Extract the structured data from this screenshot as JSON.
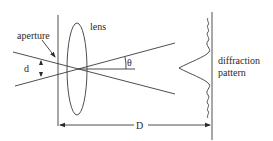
{
  "diagram": {
    "type": "optics-diffraction-setup",
    "labels": {
      "aperture": "aperture",
      "lens": "lens",
      "d": "d",
      "theta": "θ",
      "D": "D",
      "pattern_line1": "diffraction",
      "pattern_line2": "pattern"
    },
    "colors": {
      "line": "#3a3a3a",
      "text": "#2a2a2a",
      "background": "#ffffff"
    }
  }
}
